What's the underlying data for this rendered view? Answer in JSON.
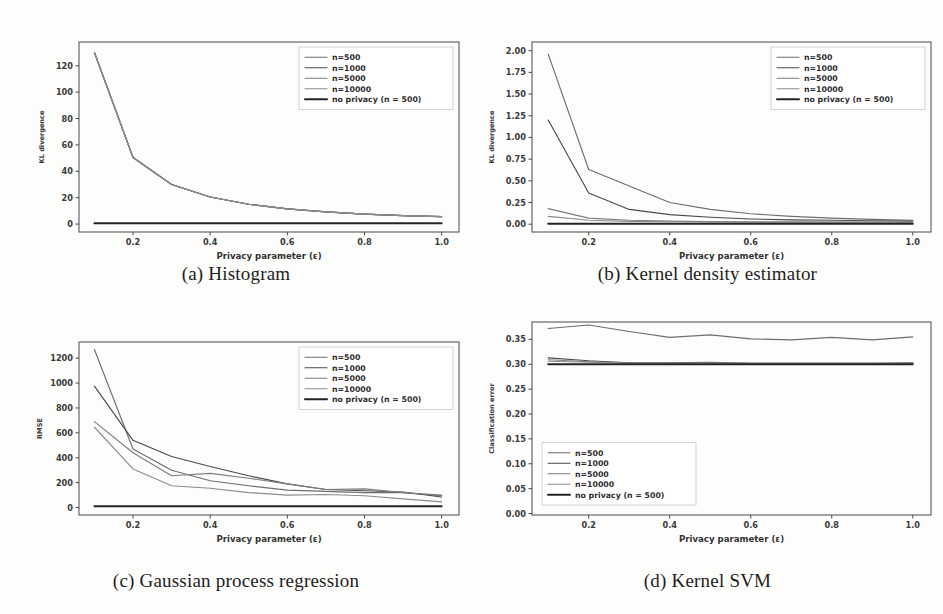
{
  "figure": {
    "background": "#fdfdfc",
    "panel_count": 4
  },
  "common": {
    "xlabel": "Privacy parameter (ε)",
    "xticks": [
      "0.2",
      "0.4",
      "0.6",
      "0.8",
      "1.0"
    ],
    "legend_labels": [
      "n=500",
      "n=1000",
      "n=5000",
      "n=10000",
      "no privacy (n = 500)"
    ],
    "series_colors": [
      "#6e6e6e",
      "#4a4a4a",
      "#7d7d7d",
      "#8c8c8c",
      "#242424"
    ],
    "x": [
      0.1,
      0.2,
      0.3,
      0.4,
      0.5,
      0.6,
      0.7,
      0.8,
      0.9,
      1.0
    ],
    "xlim": [
      0.06,
      1.045
    ]
  },
  "panels": [
    {
      "id": "a",
      "caption": "(a) Histogram",
      "legend_position": "upper-right"
    },
    {
      "id": "b",
      "caption": "(b) Kernel density estimator",
      "legend_position": "upper-right"
    },
    {
      "id": "c",
      "caption": "(c) Gaussian process regression",
      "legend_position": "upper-right"
    },
    {
      "id": "d",
      "caption": "(d) Kernel SVM",
      "legend_position": "lower-left"
    }
  ],
  "chart_data": [
    {
      "type": "line",
      "panel": "a",
      "title": "(a) Histogram",
      "xlabel": "Privacy parameter (ε)",
      "ylabel": "KL divergence",
      "x": [
        0.1,
        0.2,
        0.3,
        0.4,
        0.5,
        0.6,
        0.7,
        0.8,
        0.9,
        1.0
      ],
      "xticks": [
        0.2,
        0.4,
        0.6,
        0.8,
        1.0
      ],
      "yticks": [
        0,
        20,
        40,
        60,
        80,
        100,
        120
      ],
      "xlim": [
        0.06,
        1.045
      ],
      "ylim": [
        -6,
        138
      ],
      "grid": false,
      "legend_position": "upper right",
      "series": [
        {
          "name": "n=500",
          "values": [
            130.0,
            50.5,
            30.0,
            20.5,
            15.0,
            11.5,
            9.2,
            7.6,
            6.4,
            5.6
          ]
        },
        {
          "name": "n=1000",
          "values": [
            130.0,
            50.5,
            30.0,
            20.5,
            15.0,
            11.5,
            9.2,
            7.6,
            6.4,
            5.6
          ]
        },
        {
          "name": "n=5000",
          "values": [
            130.0,
            50.5,
            30.0,
            20.5,
            15.0,
            11.5,
            9.2,
            7.6,
            6.4,
            5.6
          ]
        },
        {
          "name": "n=10000",
          "values": [
            130.0,
            50.5,
            30.0,
            20.5,
            15.0,
            11.5,
            9.2,
            7.6,
            6.4,
            5.6
          ]
        },
        {
          "name": "no privacy (n = 500)",
          "values": [
            0.6,
            0.6,
            0.6,
            0.6,
            0.6,
            0.6,
            0.6,
            0.6,
            0.6,
            0.6
          ]
        }
      ]
    },
    {
      "type": "line",
      "panel": "b",
      "title": "(b) Kernel density estimator",
      "xlabel": "Privacy parameter (ε)",
      "ylabel": "KL divergence",
      "x": [
        0.1,
        0.2,
        0.3,
        0.4,
        0.5,
        0.6,
        0.7,
        0.8,
        0.9,
        1.0
      ],
      "xticks": [
        0.2,
        0.4,
        0.6,
        0.8,
        1.0
      ],
      "yticks": [
        0.0,
        0.25,
        0.5,
        0.75,
        1.0,
        1.25,
        1.5,
        1.75,
        2.0
      ],
      "xlim": [
        0.06,
        1.045
      ],
      "ylim": [
        -0.09,
        2.1
      ],
      "grid": false,
      "legend_position": "upper right",
      "series": [
        {
          "name": "n=500",
          "values": [
            1.96,
            0.63,
            0.44,
            0.25,
            0.17,
            0.12,
            0.09,
            0.07,
            0.055,
            0.045
          ]
        },
        {
          "name": "n=1000",
          "values": [
            1.2,
            0.36,
            0.17,
            0.11,
            0.08,
            0.06,
            0.05,
            0.045,
            0.04,
            0.035
          ]
        },
        {
          "name": "n=5000",
          "values": [
            0.18,
            0.07,
            0.045,
            0.035,
            0.03,
            0.028,
            0.026,
            0.025,
            0.024,
            0.024
          ]
        },
        {
          "name": "n=10000",
          "values": [
            0.09,
            0.045,
            0.032,
            0.028,
            0.025,
            0.023,
            0.022,
            0.021,
            0.021,
            0.021
          ]
        },
        {
          "name": "no privacy (n = 500)",
          "values": [
            0.005,
            0.005,
            0.005,
            0.005,
            0.005,
            0.005,
            0.005,
            0.005,
            0.005,
            0.005
          ]
        }
      ]
    },
    {
      "type": "line",
      "panel": "c",
      "title": "(c) Gaussian process regression",
      "xlabel": "Privacy parameter (ε)",
      "ylabel": "RMSE",
      "x": [
        0.1,
        0.2,
        0.3,
        0.4,
        0.5,
        0.6,
        0.7,
        0.8,
        0.9,
        1.0
      ],
      "xticks": [
        0.2,
        0.4,
        0.6,
        0.8,
        1.0
      ],
      "yticks": [
        0,
        200,
        400,
        600,
        800,
        1000,
        1200
      ],
      "xlim": [
        0.06,
        1.045
      ],
      "ylim": [
        -60,
        1330
      ],
      "grid": false,
      "legend_position": "upper right",
      "series": [
        {
          "name": "n=500",
          "values": [
            1270,
            470,
            300,
            215,
            175,
            140,
            130,
            120,
            120,
            95
          ]
        },
        {
          "name": "n=1000",
          "values": [
            975,
            540,
            410,
            330,
            255,
            190,
            145,
            135,
            125,
            85
          ]
        },
        {
          "name": "n=5000",
          "values": [
            690,
            440,
            255,
            275,
            235,
            190,
            145,
            150,
            120,
            100
          ]
        },
        {
          "name": "n=10000",
          "values": [
            645,
            310,
            175,
            155,
            120,
            100,
            105,
            95,
            70,
            45
          ]
        },
        {
          "name": "no privacy (n = 500)",
          "values": [
            10,
            10,
            10,
            10,
            10,
            10,
            10,
            10,
            10,
            10
          ]
        }
      ]
    },
    {
      "type": "line",
      "panel": "d",
      "title": "(d) Kernel SVM",
      "xlabel": "Privacy parameter (ε)",
      "ylabel": "Classification error",
      "x": [
        0.1,
        0.2,
        0.3,
        0.4,
        0.5,
        0.6,
        0.7,
        0.8,
        0.9,
        1.0
      ],
      "xticks": [
        0.2,
        0.4,
        0.6,
        0.8,
        1.0
      ],
      "yticks": [
        0.0,
        0.05,
        0.1,
        0.15,
        0.2,
        0.25,
        0.3,
        0.35
      ],
      "xlim": [
        0.06,
        1.045
      ],
      "ylim": [
        -0.003,
        0.385
      ],
      "grid": false,
      "legend_position": "lower left",
      "series": [
        {
          "name": "n=500",
          "values": [
            0.372,
            0.379,
            0.366,
            0.354,
            0.359,
            0.351,
            0.349,
            0.354,
            0.349,
            0.355
          ]
        },
        {
          "name": "n=1000",
          "values": [
            0.313,
            0.307,
            0.303,
            0.303,
            0.304,
            0.302,
            0.302,
            0.302,
            0.302,
            0.303
          ]
        },
        {
          "name": "n=5000",
          "values": [
            0.309,
            0.305,
            0.302,
            0.302,
            0.303,
            0.302,
            0.302,
            0.302,
            0.302,
            0.302
          ]
        },
        {
          "name": "n=10000",
          "values": [
            0.306,
            0.304,
            0.302,
            0.302,
            0.302,
            0.302,
            0.302,
            0.302,
            0.302,
            0.302
          ]
        },
        {
          "name": "no privacy (n = 500)",
          "values": [
            0.3,
            0.3,
            0.3,
            0.3,
            0.3,
            0.3,
            0.3,
            0.3,
            0.3,
            0.3
          ]
        }
      ]
    }
  ]
}
